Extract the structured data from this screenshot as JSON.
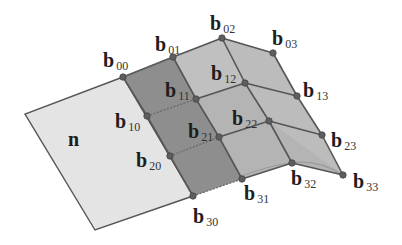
{
  "diagram": {
    "type": "bicubic-bezier-patch-control-net",
    "colors": {
      "background": "#ffffff",
      "plane_n": "#e4e4e4",
      "first_column_strip": "#8e8e8e",
      "patch_surface": "#b4b4b4",
      "patch_highlight": "#cfcfcf",
      "lines": "#555555",
      "points": "#5e5e5e"
    },
    "plane": {
      "label": "n",
      "corners": [
        [
          123,
          77
        ],
        [
          25,
          114
        ],
        [
          95,
          230
        ],
        [
          193,
          196
        ]
      ],
      "label_pos": [
        68,
        146
      ]
    },
    "control_points": [
      {
        "id": "b00",
        "base": "b",
        "sub": "00",
        "x": 123,
        "y": 77,
        "lx": 103,
        "ly": 67
      },
      {
        "id": "b01",
        "base": "b",
        "sub": "01",
        "x": 173,
        "y": 57,
        "lx": 155,
        "ly": 51
      },
      {
        "id": "b02",
        "base": "b",
        "sub": "02",
        "x": 222,
        "y": 38,
        "lx": 210,
        "ly": 30
      },
      {
        "id": "b03",
        "base": "b",
        "sub": "03",
        "x": 273,
        "y": 53,
        "lx": 272,
        "ly": 45
      },
      {
        "id": "b10",
        "base": "b",
        "sub": "10",
        "x": 147,
        "y": 116,
        "lx": 115,
        "ly": 128
      },
      {
        "id": "b11",
        "base": "b",
        "sub": "11",
        "x": 196,
        "y": 99,
        "lx": 165,
        "ly": 97
      },
      {
        "id": "b12",
        "base": "b",
        "sub": "12",
        "x": 245,
        "y": 83,
        "lx": 211,
        "ly": 80
      },
      {
        "id": "b13",
        "base": "b",
        "sub": "13",
        "x": 297,
        "y": 96,
        "lx": 303,
        "ly": 97
      },
      {
        "id": "b20",
        "base": "b",
        "sub": "20",
        "x": 170,
        "y": 156,
        "lx": 136,
        "ly": 167
      },
      {
        "id": "b21",
        "base": "b",
        "sub": "21",
        "x": 219,
        "y": 137,
        "lx": 188,
        "ly": 138
      },
      {
        "id": "b22",
        "base": "b",
        "sub": "22",
        "x": 269,
        "y": 121,
        "lx": 232,
        "ly": 125
      },
      {
        "id": "b23",
        "base": "b",
        "sub": "23",
        "x": 322,
        "y": 135,
        "lx": 331,
        "ly": 147
      },
      {
        "id": "b30",
        "base": "b",
        "sub": "30",
        "x": 193,
        "y": 196,
        "lx": 193,
        "ly": 223
      },
      {
        "id": "b31",
        "base": "b",
        "sub": "31",
        "x": 242,
        "y": 179,
        "lx": 244,
        "ly": 200
      },
      {
        "id": "b32",
        "base": "b",
        "sub": "32",
        "x": 292,
        "y": 163,
        "lx": 291,
        "ly": 185
      },
      {
        "id": "b33",
        "base": "b",
        "sub": "33",
        "x": 343,
        "y": 175,
        "lx": 353,
        "ly": 188
      }
    ]
  }
}
